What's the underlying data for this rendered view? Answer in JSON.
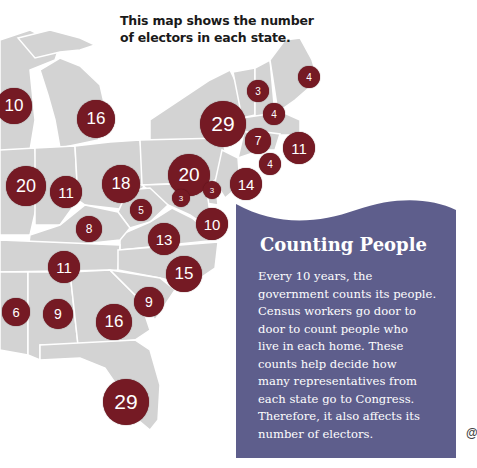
{
  "caption": {
    "line1": "This map shows the number",
    "line2": "of electors in each state."
  },
  "colors": {
    "bubble": "#751a24",
    "land": "#d3d3d3",
    "border": "#ffffff",
    "card": "#5e5e8c"
  },
  "electors": [
    {
      "state": "Wisconsin",
      "value": "10",
      "x": -4,
      "y": 88,
      "d": 36
    },
    {
      "state": "Michigan",
      "value": "16",
      "x": 77,
      "y": 100,
      "d": 38
    },
    {
      "state": "New York",
      "value": "29",
      "x": 200,
      "y": 101,
      "d": 46
    },
    {
      "state": "Vermont",
      "value": "3",
      "x": 247,
      "y": 80,
      "d": 22
    },
    {
      "state": "Maine",
      "value": "4",
      "x": 298,
      "y": 66,
      "d": 22
    },
    {
      "state": "New Hampshire",
      "value": "4",
      "x": 263,
      "y": 103,
      "d": 22
    },
    {
      "state": "Connecticut",
      "value": "7",
      "x": 245,
      "y": 128,
      "d": 26
    },
    {
      "state": "Massachusetts",
      "value": "11",
      "x": 283,
      "y": 132,
      "d": 32
    },
    {
      "state": "Rhode Island",
      "value": "4",
      "x": 259,
      "y": 153,
      "d": 22
    },
    {
      "state": "Pennsylvania",
      "value": "20",
      "x": 168,
      "y": 154,
      "d": 42
    },
    {
      "state": "Illinois",
      "value": "20",
      "x": 6,
      "y": 166,
      "d": 40
    },
    {
      "state": "Indiana",
      "value": "11",
      "x": 50,
      "y": 176,
      "d": 32
    },
    {
      "state": "Ohio",
      "value": "18",
      "x": 102,
      "y": 165,
      "d": 38
    },
    {
      "state": "New Jersey",
      "value": "14",
      "x": 230,
      "y": 168,
      "d": 32
    },
    {
      "state": "Delaware",
      "value": "3",
      "x": 203,
      "y": 181,
      "d": 18
    },
    {
      "state": "Maryland",
      "value": "10",
      "x": 196,
      "y": 208,
      "d": 32
    },
    {
      "state": "District of Columbia",
      "value": "3",
      "x": 172,
      "y": 189,
      "d": 18
    },
    {
      "state": "West Virginia",
      "value": "5",
      "x": 130,
      "y": 199,
      "d": 22
    },
    {
      "state": "Virginia",
      "value": "13",
      "x": 148,
      "y": 223,
      "d": 32
    },
    {
      "state": "Kentucky",
      "value": "8",
      "x": 76,
      "y": 216,
      "d": 26
    },
    {
      "state": "Tennessee",
      "value": "11",
      "x": 48,
      "y": 251,
      "d": 32
    },
    {
      "state": "North Carolina",
      "value": "15",
      "x": 166,
      "y": 256,
      "d": 36
    },
    {
      "state": "South Carolina",
      "value": "9",
      "x": 134,
      "y": 287,
      "d": 30
    },
    {
      "state": "Mississippi",
      "value": "6",
      "x": 2,
      "y": 298,
      "d": 28
    },
    {
      "state": "Alabama",
      "value": "9",
      "x": 43,
      "y": 299,
      "d": 30
    },
    {
      "state": "Georgia",
      "value": "16",
      "x": 96,
      "y": 304,
      "d": 36
    },
    {
      "state": "Florida",
      "value": "29",
      "x": 103,
      "y": 379,
      "d": 46
    }
  ],
  "card": {
    "title": "Counting People",
    "lines": [
      "Every 10 years, the",
      "government counts its people.",
      "Census workers go door to",
      "door to count people who",
      "live in each home.  These",
      "counts help decide how",
      "many representatives from",
      "each state go to Congress.",
      "Therefore, it also affects its",
      "number of electors."
    ]
  },
  "corner_glyph": "@"
}
